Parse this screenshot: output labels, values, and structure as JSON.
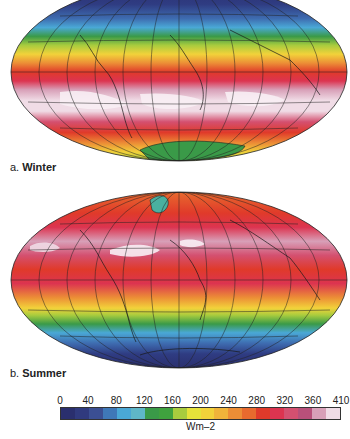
{
  "chart_data": {
    "type": "heatmap",
    "panels": [
      {
        "id": "a",
        "label_prefix": "a.",
        "label_name": "Winter",
        "projection": "Hammer/Aitoff (elliptical)",
        "bands_north_to_south": [
          {
            "lat": "north pole",
            "value_range": "0-40"
          },
          {
            "lat": "60N",
            "value_range": "80-120"
          },
          {
            "lat": "45N",
            "value_range": "160-200"
          },
          {
            "lat": "30N",
            "value_range": "240-280"
          },
          {
            "lat": "15N",
            "value_range": "280-320"
          },
          {
            "lat": "equator-20S",
            "value_range": "360-410"
          },
          {
            "lat": "40S",
            "value_range": "320-360"
          },
          {
            "lat": "55S",
            "value_range": "280-320"
          },
          {
            "lat": "65S",
            "value_range": "200-240"
          },
          {
            "lat": "antarctica",
            "value_range": "120-160"
          }
        ]
      },
      {
        "id": "b",
        "label_prefix": "b.",
        "label_name": "Summer",
        "projection": "Hammer/Aitoff (elliptical)",
        "bands_north_to_south": [
          {
            "lat": "greenland",
            "value_range": "120-160"
          },
          {
            "lat": "60N",
            "value_range": "280-320"
          },
          {
            "lat": "30N",
            "value_range": "360-410"
          },
          {
            "lat": "15N",
            "value_range": "320-360"
          },
          {
            "lat": "equator",
            "value_range": "280-320"
          },
          {
            "lat": "20S",
            "value_range": "240-280"
          },
          {
            "lat": "35S",
            "value_range": "200-240"
          },
          {
            "lat": "45S",
            "value_range": "120-160"
          },
          {
            "lat": "55S",
            "value_range": "80-120"
          },
          {
            "lat": "south pole",
            "value_range": "0-40"
          }
        ]
      }
    ],
    "colorbar": {
      "ticks": [
        "0",
        "40",
        "80",
        "120",
        "160",
        "200",
        "240",
        "280",
        "320",
        "360",
        "410"
      ],
      "unit": "Wm–2",
      "colors": [
        "#2a2f6e",
        "#303a7e",
        "#3b4f93",
        "#3f78b8",
        "#4aa8d6",
        "#5fb7c8",
        "#3a9a48",
        "#3fa23e",
        "#a8cc3e",
        "#e6e23a",
        "#f2d23a",
        "#f0b43a",
        "#ec8e36",
        "#e86a2e",
        "#e03a2a",
        "#dc3450",
        "#d45070",
        "#b8507a",
        "#d8a0b8",
        "#f0dce6"
      ]
    }
  },
  "labels": {
    "a_prefix": "a.",
    "a_name": "Winter",
    "b_prefix": "b.",
    "b_name": "Summer",
    "unit": "Wm–2"
  }
}
